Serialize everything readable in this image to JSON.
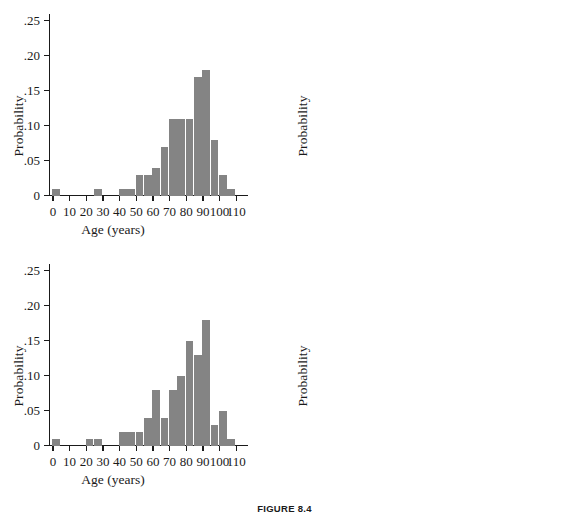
{
  "figure": {
    "caption": "FIGURE 8.4"
  },
  "axis": {
    "ylabel": "Probability",
    "xlabel": "Age (years)",
    "yticks": [
      "0",
      ".05",
      ".10",
      ".15",
      ".20",
      ".25"
    ],
    "ytick_values": [
      0,
      0.05,
      0.1,
      0.15,
      0.2,
      0.25
    ],
    "xticks": [
      "0",
      "10",
      "20",
      "30",
      "40",
      "50",
      "60",
      "70",
      "80",
      "90",
      "100",
      "110"
    ],
    "xtick_values": [
      0,
      10,
      20,
      30,
      40,
      50,
      60,
      70,
      80,
      90,
      100,
      110
    ],
    "bar_color": "#848484",
    "axis_color": "#1a1a1a"
  },
  "chart_data": [
    {
      "type": "bar",
      "panel": "top-left",
      "title": "",
      "xlabel": "Age (years)",
      "ylabel": "Probability",
      "xlim": [
        -2,
        112
      ],
      "ylim": [
        0,
        0.26
      ],
      "bin_width": 5,
      "grid": false,
      "legend": null,
      "bins": [
        0,
        5,
        10,
        15,
        20,
        25,
        30,
        35,
        40,
        45,
        50,
        55,
        60,
        65,
        70,
        75,
        80,
        85,
        90,
        95,
        100,
        105,
        110
      ],
      "bin_starts": [
        0,
        25,
        40,
        45,
        50,
        55,
        60,
        65,
        70,
        75,
        80,
        85,
        90,
        95,
        100,
        105
      ],
      "values": [
        0.01,
        0.01,
        0.01,
        0.01,
        0.03,
        0.03,
        0.04,
        0.07,
        0.11,
        0.11,
        0.11,
        0.17,
        0.18,
        0.08,
        0.03,
        0.01
      ]
    },
    {
      "type": "bar",
      "panel": "top-right",
      "title": "",
      "xlabel": "Age (years)",
      "ylabel": "Probability",
      "xlim": [
        -2,
        112
      ],
      "ylim": [
        0,
        0.26
      ],
      "bin_width": 5,
      "grid": false,
      "legend": null,
      "bin_starts": [
        0,
        5,
        20,
        25,
        50,
        55,
        60,
        65,
        70,
        75,
        80,
        85,
        90,
        95,
        100,
        105
      ],
      "values": [
        0.02,
        0.01,
        0.01,
        0.01,
        0.04,
        0.04,
        0.02,
        0.07,
        0.08,
        0.07,
        0.08,
        0.21,
        0.24,
        0.08,
        0.01,
        0.01
      ]
    },
    {
      "type": "bar",
      "panel": "bottom-left",
      "title": "",
      "xlabel": "Age (years)",
      "ylabel": "Probability",
      "xlim": [
        -2,
        112
      ],
      "ylim": [
        0,
        0.26
      ],
      "bin_width": 5,
      "grid": false,
      "legend": null,
      "bin_starts": [
        0,
        20,
        25,
        40,
        45,
        50,
        55,
        60,
        65,
        70,
        75,
        80,
        85,
        90,
        95,
        100,
        105
      ],
      "values": [
        0.01,
        0.01,
        0.01,
        0.02,
        0.02,
        0.02,
        0.04,
        0.08,
        0.04,
        0.08,
        0.1,
        0.15,
        0.13,
        0.18,
        0.03,
        0.05,
        0.01
      ]
    },
    {
      "type": "bar",
      "panel": "bottom-right",
      "title": "",
      "xlabel": "Age (years)",
      "ylabel": "Probability",
      "xlim": [
        -2,
        112
      ],
      "ylim": [
        0,
        0.26
      ],
      "bin_width": 5,
      "grid": false,
      "legend": null,
      "bin_starts": [
        0,
        10,
        15,
        35,
        55,
        60,
        65,
        70,
        75,
        80,
        85,
        90,
        95,
        100,
        105
      ],
      "values": [
        0.02,
        0.01,
        0.03,
        0.01,
        0.05,
        0.03,
        0.08,
        0.11,
        0.12,
        0.16,
        0.14,
        0.17,
        0.04,
        0.03,
        0.01
      ]
    }
  ]
}
